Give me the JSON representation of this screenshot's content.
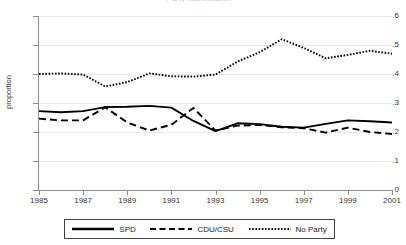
{
  "chart_data": {
    "type": "line",
    "title": "Party Identification",
    "xlabel": "",
    "ylabel": "proportion",
    "xlim": [
      1985,
      2001
    ],
    "ylim": [
      0,
      0.6
    ],
    "xticks": [
      1985,
      1987,
      1989,
      1991,
      1993,
      1995,
      1997,
      1999,
      2001
    ],
    "xtick_labels": [
      "1985",
      "1987",
      "1989",
      "1991",
      "1993",
      "1995",
      "1997",
      "1999",
      "2001"
    ],
    "yticks": [
      0,
      0.1,
      0.2,
      0.3,
      0.4,
      0.5,
      0.6
    ],
    "ytick_labels": [
      "0",
      ".1",
      ".2",
      ".3",
      ".4",
      ".5",
      ".6"
    ],
    "grid": true,
    "legend_position": "bottom-outside",
    "x": [
      1985,
      1986,
      1987,
      1988,
      1989,
      1990,
      1991,
      1992,
      1993,
      1994,
      1995,
      1996,
      1997,
      1998,
      1999,
      2000,
      2001
    ],
    "series": [
      {
        "name": "SPD",
        "style": "solid",
        "color": "#000000",
        "values": [
          0.272,
          0.268,
          0.272,
          0.286,
          0.287,
          0.29,
          0.284,
          0.238,
          0.203,
          0.23,
          0.227,
          0.218,
          0.215,
          0.228,
          0.24,
          0.237,
          0.233
        ]
      },
      {
        "name": "CDU/CSU",
        "style": "dashed",
        "color": "#000000",
        "values": [
          0.246,
          0.24,
          0.24,
          0.285,
          0.233,
          0.205,
          0.225,
          0.283,
          0.205,
          0.222,
          0.224,
          0.216,
          0.213,
          0.198,
          0.215,
          0.2,
          0.193
        ]
      },
      {
        "name": "No Party",
        "style": "dotted",
        "color": "#000000",
        "values": [
          0.4,
          0.402,
          0.398,
          0.357,
          0.372,
          0.402,
          0.392,
          0.391,
          0.398,
          0.443,
          0.475,
          0.52,
          0.49,
          0.454,
          0.466,
          0.48,
          0.47
        ]
      }
    ],
    "series_tail": {
      "No Party": [
        0.455,
        0.443,
        0.47,
        0.487
      ]
    }
  },
  "legend": {
    "entries": [
      {
        "label": "SPD",
        "swatch": "solid-line-swatch"
      },
      {
        "label": "CDU/CSU",
        "swatch": "dashed-line-swatch"
      },
      {
        "label": "No Party",
        "swatch": "dotted-line-swatch"
      }
    ]
  }
}
